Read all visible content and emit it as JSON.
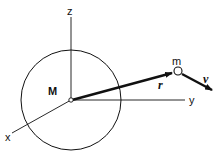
{
  "diagram": {
    "labels": {
      "z_axis": "z",
      "y_axis": "y",
      "x_axis": "x",
      "central_mass": "M",
      "orbiting_mass": "m",
      "position_vector": "r",
      "velocity_vector": "v"
    },
    "colors": {
      "stroke": "#111111",
      "background": "#ffffff"
    }
  }
}
